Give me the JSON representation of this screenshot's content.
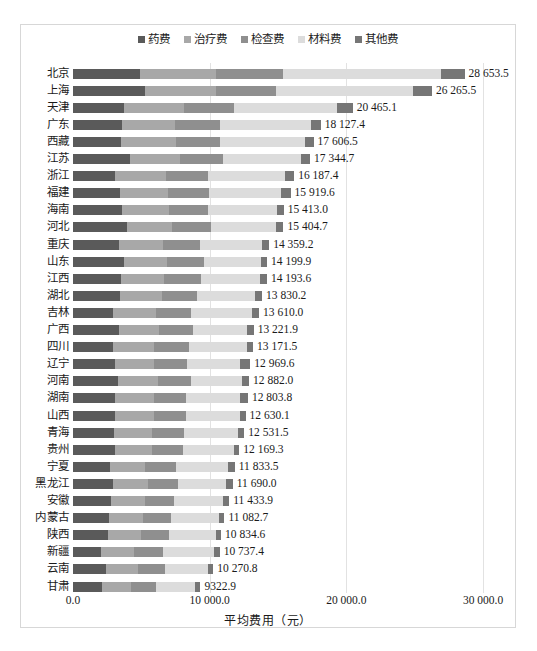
{
  "chart_data": {
    "type": "bar",
    "orientation": "horizontal",
    "stacked": true,
    "title": "",
    "xlabel": "平均费用（元）",
    "ylabel": "",
    "xlim": [
      0,
      30000
    ],
    "xticks": [
      "0.0",
      "10 000.0",
      "20 000.0",
      "30 000.0"
    ],
    "xtick_values": [
      0,
      10000,
      20000,
      30000
    ],
    "grid": true,
    "legend_position": "top-center",
    "legend": [
      "药费",
      "治疗费",
      "检查费",
      "材料费",
      "其他费"
    ],
    "series_colors": [
      "#5a5a5a",
      "#a8a8a8",
      "#8f8f8f",
      "#dcdcdc",
      "#767676"
    ],
    "categories": [
      "北京",
      "上海",
      "天津",
      "广东",
      "西藏",
      "江苏",
      "浙江",
      "福建",
      "海南",
      "河北",
      "重庆",
      "山东",
      "江西",
      "湖北",
      "吉林",
      "广西",
      "四川",
      "辽宁",
      "河南",
      "湖南",
      "山西",
      "青海",
      "贵州",
      "宁夏",
      "黑龙江",
      "安徽",
      "内蒙古",
      "陕西",
      "新疆",
      "云南",
      "甘肃"
    ],
    "totals": [
      28653.5,
      26265.5,
      20465.1,
      18127.4,
      17606.5,
      17344.7,
      16187.4,
      15919.6,
      15413.0,
      15404.7,
      14359.2,
      14199.9,
      14193.6,
      13830.2,
      13610.0,
      13221.9,
      13171.5,
      12969.6,
      12882.0,
      12803.8,
      12630.1,
      12531.5,
      12169.3,
      11833.5,
      11690.0,
      11433.9,
      11082.7,
      10834.6,
      10737.4,
      10270.8,
      9322.9
    ],
    "total_labels": [
      "28 653.5",
      "26 265.5",
      "20 465.1",
      "18 127.4",
      "17 606.5",
      "17 344.7",
      "16 187.4",
      "15 919.6",
      "15 413.0",
      "15 404.7",
      "14 359.2",
      "14 199.9",
      "14 193.6",
      "13 830.2",
      "13 610.0",
      "13 221.9",
      "13 171.5",
      "12 969.6",
      "12 882.0",
      "12 803.8",
      "12 630.1",
      "12 531.5",
      "12 169.3",
      "11 833.5",
      "11 690.0",
      "11 433.9",
      "11 082.7",
      "10 834.6",
      "10 737.4",
      "10 270.8",
      "9322.9"
    ],
    "series": [
      {
        "name": "药费",
        "values": [
          4900,
          5250,
          3750,
          3600,
          3500,
          4150,
          3050,
          3450,
          3600,
          3950,
          3400,
          3750,
          3500,
          3450,
          2950,
          3350,
          2950,
          3100,
          3300,
          3050,
          3100,
          3000,
          3050,
          2700,
          2900,
          2750,
          2650,
          2550,
          2050,
          2450,
          2150
        ]
      },
      {
        "name": "治疗费",
        "values": [
          5600,
          5200,
          4400,
          3900,
          4050,
          3700,
          3750,
          3500,
          3400,
          3300,
          3200,
          3150,
          3150,
          3050,
          3100,
          2950,
          3000,
          2850,
          2900,
          2850,
          2800,
          2750,
          2700,
          2600,
          2600,
          2500,
          2450,
          2400,
          2450,
          2300,
          2100
        ]
      },
      {
        "name": "检查费",
        "values": [
          4900,
          4400,
          3600,
          3250,
          3200,
          3100,
          3050,
          3000,
          2900,
          2850,
          2700,
          2650,
          2700,
          2600,
          2600,
          2500,
          2550,
          2400,
          2450,
          2400,
          2400,
          2350,
          2300,
          2250,
          2200,
          2150,
          2100,
          2050,
          2100,
          1950,
          1800
        ]
      },
      {
        "name": "材料费",
        "values": [
          11500,
          10050,
          7550,
          6650,
          6200,
          5700,
          5700,
          5300,
          5000,
          4750,
          4500,
          4200,
          4350,
          4200,
          4450,
          3950,
          4200,
          3900,
          3750,
          3950,
          3900,
          3950,
          3700,
          3800,
          3500,
          3600,
          3500,
          3450,
          3700,
          3200,
          2900
        ]
      },
      {
        "name": "其他费",
        "values": [
          1753.5,
          1365.5,
          1165.1,
          727.4,
          656.5,
          694.7,
          637.4,
          669.6,
          513.0,
          554.7,
          559.2,
          449.9,
          493.6,
          530.2,
          510.0,
          471.9,
          471.5,
          719.6,
          482.0,
          553.8,
          430.1,
          481.5,
          419.3,
          483.5,
          490.0,
          433.9,
          382.7,
          384.6,
          437.4,
          370.8,
          372.9
        ]
      }
    ]
  }
}
